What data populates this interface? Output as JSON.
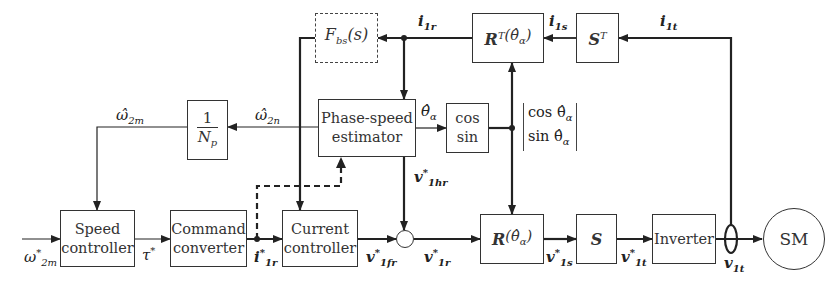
{
  "diagram": {
    "blocks": {
      "speed_controller": {
        "line1": "Speed",
        "line2": "controller"
      },
      "command_converter": {
        "line1": "Command",
        "line2": "converter"
      },
      "current_controller": {
        "line1": "Current",
        "line2": "controller"
      },
      "phase_speed_estimator": {
        "line1": "Phase-speed",
        "line2": "estimator"
      },
      "cos_sin": {
        "line1": "cos",
        "line2": "sin"
      },
      "gain_inverse_np": {
        "numerator": "1",
        "denominator": "N",
        "denominator_sub": "p"
      },
      "filter_fbs": {
        "main": "F",
        "sub": "bs",
        "arg": "(s)"
      },
      "rotation_R": {
        "main": "R",
        "arg": "(θ̂",
        "arg_sub": "α",
        "close": ")"
      },
      "rotation_RT": {
        "main": "R",
        "sup": "T",
        "arg": "(θ̂",
        "arg_sub": "α",
        "close": ")"
      },
      "transform_S": {
        "main": "S"
      },
      "transform_ST": {
        "main": "S",
        "sup": "T"
      },
      "inverter": {
        "label": "Inverter"
      },
      "motor": {
        "label": "SM"
      }
    },
    "signals": {
      "omega_2m_ref": {
        "main": "ω",
        "sup": "*",
        "sub": "2m"
      },
      "tau_ref": {
        "main": "τ",
        "sup": "*"
      },
      "i_1r_ref": {
        "main": "i",
        "sup": "*",
        "sub": "1r"
      },
      "v_1fr_ref": {
        "main": "v",
        "sup": "*",
        "sub": "1fr"
      },
      "v_1r_ref": {
        "main": "v",
        "sup": "*",
        "sub": "1r"
      },
      "v_1hr_ref": {
        "main": "v",
        "sup": "*",
        "sub": "1hr"
      },
      "v_1s_ref": {
        "main": "v",
        "sup": "*",
        "sub": "1s"
      },
      "v_1t_ref": {
        "main": "v",
        "sup": "*",
        "sub": "1t"
      },
      "v_1t": {
        "main": "v",
        "sub": "1t"
      },
      "i_1r": {
        "main": "i",
        "sub": "1r"
      },
      "i_1s": {
        "main": "i",
        "sub": "1s"
      },
      "i_1t": {
        "main": "i",
        "sub": "1t"
      },
      "omega_2m_hat": {
        "main": "ω̂",
        "sub": "2m"
      },
      "omega_2n_hat": {
        "main": "ω̂",
        "sub": "2n"
      },
      "theta_alpha_hat": {
        "main": "θ̂",
        "sub": "α"
      },
      "cos_sin_vector": {
        "row1": "cos θ̂",
        "row1_sub": "α",
        "row2": "sin θ̂",
        "row2_sub": "α"
      }
    }
  }
}
